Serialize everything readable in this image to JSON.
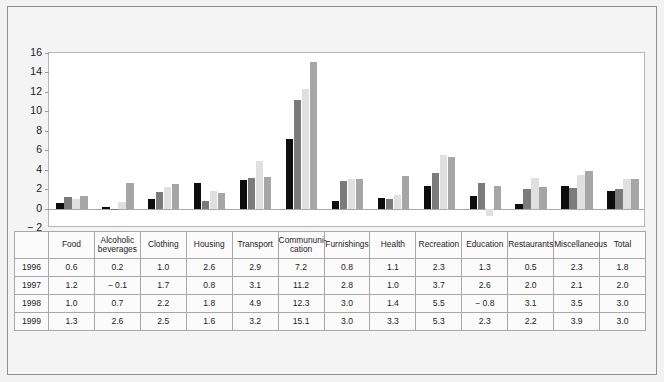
{
  "chart_data": {
    "type": "bar",
    "title": "",
    "subtitle": "",
    "xlabel": "",
    "ylabel": "",
    "ylim": [
      -2,
      16
    ],
    "yticks": [
      -2,
      0,
      2,
      4,
      6,
      8,
      10,
      12,
      14,
      16
    ],
    "ytick_labels": [
      "− 2",
      "0",
      "2",
      "4",
      "6",
      "8",
      "10",
      "12",
      "14",
      "16"
    ],
    "grid": false,
    "legend_position": "none",
    "categories": [
      "Food",
      "Alcoholic beverages",
      "Clothing",
      "Housing",
      "Transport",
      "Commununi-cation",
      "Furnishings",
      "Health",
      "Recreation",
      "Education",
      "Restaurants",
      "Miscellaneous",
      "Total"
    ],
    "series": [
      {
        "name": "1996",
        "color": "#0d0d0d",
        "values": [
          0.6,
          0.2,
          1.0,
          2.6,
          2.9,
          7.2,
          0.8,
          1.1,
          2.3,
          1.3,
          0.5,
          2.3,
          1.8
        ]
      },
      {
        "name": "1997",
        "color": "#7b7b7b",
        "values": [
          1.2,
          -0.1,
          1.7,
          0.8,
          3.1,
          11.2,
          2.8,
          1.0,
          3.7,
          2.6,
          2.0,
          2.1,
          2.0
        ]
      },
      {
        "name": "1998",
        "color": "#e0e0e0",
        "values": [
          1.0,
          0.7,
          2.2,
          1.8,
          4.9,
          12.3,
          3.0,
          1.4,
          5.5,
          -0.8,
          3.1,
          3.5,
          3.0
        ]
      },
      {
        "name": "1999",
        "color": "#a6a6a6",
        "values": [
          1.3,
          2.6,
          2.5,
          1.6,
          3.2,
          15.1,
          3.0,
          3.3,
          5.3,
          2.3,
          2.2,
          3.9,
          3.0
        ]
      }
    ]
  },
  "table": {
    "corner_label": "",
    "headers": [
      {
        "line1": "Food",
        "line2": ""
      },
      {
        "line1": "Alcoholic",
        "line2": "beverages"
      },
      {
        "line1": "Clothing",
        "line2": ""
      },
      {
        "line1": "Housing",
        "line2": ""
      },
      {
        "line1": "Transport",
        "line2": ""
      },
      {
        "line1": "Commununi-",
        "line2": "cation"
      },
      {
        "line1": "Furnishings",
        "line2": ""
      },
      {
        "line1": "Health",
        "line2": ""
      },
      {
        "line1": "Recreation",
        "line2": ""
      },
      {
        "line1": "Education",
        "line2": ""
      },
      {
        "line1": "Restaurants",
        "line2": ""
      },
      {
        "line1": "Miscellaneous",
        "line2": ""
      },
      {
        "line1": "Total",
        "line2": ""
      }
    ],
    "rows": [
      {
        "year": "1996",
        "cells": [
          "0.6",
          "0.2",
          "1.0",
          "2.6",
          "2.9",
          "7.2",
          "0.8",
          "1.1",
          "2.3",
          "1.3",
          "0.5",
          "2.3",
          "1.8"
        ]
      },
      {
        "year": "1997",
        "cells": [
          "1.2",
          "− 0.1",
          "1.7",
          "0.8",
          "3.1",
          "11.2",
          "2.8",
          "1.0",
          "3.7",
          "2.6",
          "2.0",
          "2.1",
          "2.0"
        ]
      },
      {
        "year": "1998",
        "cells": [
          "1.0",
          "0.7",
          "2.2",
          "1.8",
          "4.9",
          "12.3",
          "3.0",
          "1.4",
          "5.5",
          "− 0.8",
          "3.1",
          "3.5",
          "3.0"
        ]
      },
      {
        "year": "1999",
        "cells": [
          "1.3",
          "2.6",
          "2.5",
          "1.6",
          "3.2",
          "15.1",
          "3.0",
          "3.3",
          "5.3",
          "2.3",
          "2.2",
          "3.9",
          "3.0"
        ]
      }
    ]
  },
  "colors": {
    "background": "#f2f2f2",
    "panel": "#ffffff",
    "frame": "#8f8f8f",
    "series_1996": "#0d0d0d",
    "series_1997": "#7b7b7b",
    "series_1998": "#e0e0e0",
    "series_1999": "#a6a6a6"
  }
}
